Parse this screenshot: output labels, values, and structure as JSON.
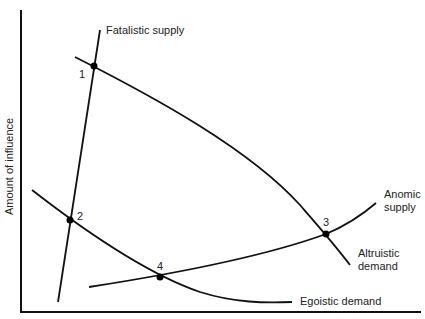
{
  "diagram": {
    "type": "supply-demand curves",
    "y_axis_label": "Amount of influence",
    "x_axis_label": "",
    "curves": [
      {
        "id": "fatalistic-supply",
        "label": "Fatalistic supply",
        "kind": "supply"
      },
      {
        "id": "altruistic-demand",
        "label_line1": "Altruistic",
        "label_line2": "demand",
        "kind": "demand"
      },
      {
        "id": "egoistic-demand",
        "label": "Egoistic demand",
        "kind": "demand"
      },
      {
        "id": "anomic-supply",
        "label_line1": "Anomic",
        "label_line2": "supply",
        "kind": "supply"
      }
    ],
    "points": [
      {
        "label": "1",
        "between": [
          "fatalistic-supply",
          "altruistic-demand"
        ]
      },
      {
        "label": "2",
        "between": [
          "fatalistic-supply",
          "egoistic-demand"
        ]
      },
      {
        "label": "3",
        "between": [
          "anomic-supply",
          "altruistic-demand"
        ]
      },
      {
        "label": "4",
        "between": [
          "anomic-supply",
          "egoistic-demand"
        ]
      }
    ],
    "colors": {
      "line": "#111111",
      "background": "#ffffff"
    }
  }
}
